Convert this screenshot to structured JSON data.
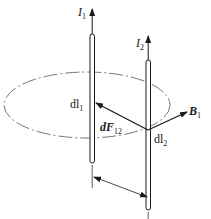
{
  "diagram": {
    "title": "",
    "colors": {
      "line": "#1a1a1a",
      "background": "#ffffff",
      "ellipse": "#555555"
    },
    "wire1": {
      "current_label": "I",
      "current_sub": "1",
      "element_label": "dl",
      "element_sub": "1"
    },
    "wire2": {
      "current_label": "I",
      "current_sub": "2",
      "element_label": "dl",
      "element_sub": "2"
    },
    "force": {
      "label": "dF",
      "sub": "12"
    },
    "field": {
      "label": "B",
      "sub": "1"
    },
    "distance_marker": "double-headed arrow between wires (separation)"
  }
}
